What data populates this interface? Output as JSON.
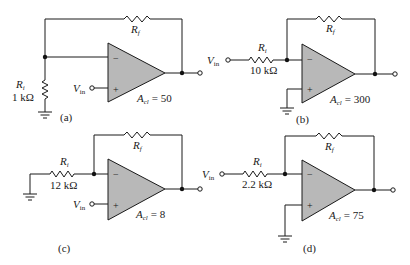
{
  "figure": {
    "circuits": [
      {
        "id": "a",
        "caption": "(a)",
        "ri_label": "R",
        "ri_sub": "i",
        "ri_value": "1 kΩ",
        "rf_label": "R",
        "rf_sub": "f",
        "vin_label": "V",
        "vin_sub": "in",
        "gain_label": "A",
        "gain_sub": "cl",
        "gain_value": "= 50",
        "minus": "−",
        "plus": "+"
      },
      {
        "id": "b",
        "caption": "(b)",
        "ri_label": "R",
        "ri_sub": "i",
        "ri_value": "10 kΩ",
        "rf_label": "R",
        "rf_sub": "f",
        "vin_label": "V",
        "vin_sub": "in",
        "gain_label": "A",
        "gain_sub": "cl",
        "gain_value": "= 300",
        "minus": "−",
        "plus": "+"
      },
      {
        "id": "c",
        "caption": "(c)",
        "ri_label": "R",
        "ri_sub": "i",
        "ri_value": "12 kΩ",
        "rf_label": "R",
        "rf_sub": "f",
        "vin_label": "V",
        "vin_sub": "in",
        "gain_label": "A",
        "gain_sub": "cl",
        "gain_value": "= 8",
        "minus": "−",
        "plus": "+"
      },
      {
        "id": "d",
        "caption": "(d)",
        "ri_label": "R",
        "ri_sub": "i",
        "ri_value": "2.2 kΩ",
        "rf_label": "R",
        "rf_sub": "f",
        "vin_label": "V",
        "vin_sub": "in",
        "gain_label": "A",
        "gain_sub": "cl",
        "gain_value": "= 75",
        "minus": "−",
        "plus": "+"
      }
    ]
  }
}
